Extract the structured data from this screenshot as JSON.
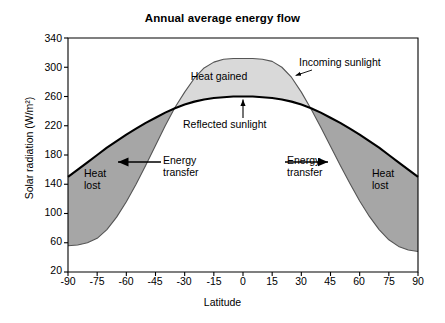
{
  "chart_data": {
    "type": "area",
    "title": "Annual average energy flow",
    "xlabel": "Latitude",
    "ylabel": "Solar radiation (W/m²)",
    "xlim": [
      -90,
      90
    ],
    "ylim": [
      20,
      340
    ],
    "xticks": [
      -90,
      -75,
      -60,
      -45,
      -30,
      -15,
      0,
      15,
      30,
      45,
      60,
      75,
      90
    ],
    "yticks": [
      20,
      60,
      100,
      140,
      180,
      220,
      260,
      300,
      340
    ],
    "xtick_labels": [
      "-90",
      "-75",
      "-60",
      "-45",
      "-30",
      "-15",
      "0",
      "15",
      "30",
      "45",
      "60",
      "75",
      "90"
    ],
    "ytick_labels": [
      "20",
      "60",
      "100",
      "140",
      "180",
      "220",
      "260",
      "300",
      "340"
    ],
    "grid": false,
    "legend": "none",
    "x": [
      -90,
      -85,
      -80,
      -75,
      -70,
      -65,
      -60,
      -55,
      -50,
      -45,
      -40,
      -35,
      -30,
      -25,
      -20,
      -15,
      -10,
      -5,
      0,
      5,
      10,
      15,
      20,
      25,
      30,
      35,
      40,
      45,
      50,
      55,
      60,
      65,
      70,
      75,
      80,
      85,
      90
    ],
    "series": [
      {
        "name": "Incoming sunlight",
        "values": [
          56,
          57,
          60,
          66,
          78,
          95,
          116,
          140,
          166,
          193,
          220,
          245,
          266,
          285,
          299,
          307,
          311,
          312,
          312,
          312,
          311,
          308,
          300,
          286,
          266,
          243,
          218,
          192,
          166,
          141,
          117,
          96,
          78,
          64,
          55,
          50,
          48
        ]
      },
      {
        "name": "Reflected sunlight",
        "values": [
          150,
          160,
          170,
          180,
          190,
          199,
          208,
          216,
          224,
          231,
          238,
          244,
          249,
          253,
          256,
          258,
          259,
          260,
          260,
          260,
          259,
          258,
          256,
          253,
          249,
          244,
          238,
          231,
          224,
          216,
          208,
          199,
          190,
          180,
          170,
          160,
          150
        ]
      }
    ],
    "regions": [
      {
        "name": "heat-gained",
        "label": "Heat gained",
        "color": "#d9d9d9",
        "between": [
          "Reflected sunlight",
          "Incoming sunlight"
        ],
        "where": "incoming > reflected"
      },
      {
        "name": "heat-lost-left",
        "label": "Heat lost",
        "color": "#a6a6a6",
        "between": [
          "Incoming sunlight",
          "Reflected sunlight"
        ],
        "where": "latitude < -34"
      },
      {
        "name": "heat-lost-right",
        "label": "Heat lost",
        "color": "#a6a6a6",
        "between": [
          "Incoming sunlight",
          "Reflected sunlight"
        ],
        "where": "latitude > 34"
      }
    ],
    "annotations": [
      {
        "name": "incoming-sunlight",
        "text": "Incoming sunlight",
        "points_to": [
          26,
          282
        ]
      },
      {
        "name": "reflected-sunlight",
        "text": "Reflected sunlight",
        "points_to": [
          0,
          260
        ]
      },
      {
        "name": "heat-gained",
        "text": "Heat gained",
        "at": [
          -6,
          288
        ]
      },
      {
        "name": "energy-transfer-left",
        "text": "Energy\ntransfer",
        "arrow": "left",
        "at": [
          -40,
          168
        ]
      },
      {
        "name": "energy-transfer-right",
        "text": "Energy\ntransfer",
        "arrow": "right",
        "at": [
          40,
          168
        ]
      },
      {
        "name": "heat-lost-left",
        "text": "Heat\nlost",
        "at": [
          -72,
          145
        ]
      },
      {
        "name": "heat-lost-right",
        "text": "Heat\nlost",
        "at": [
          72,
          145
        ]
      }
    ]
  },
  "colors": {
    "axis": "#000000",
    "curve": "#000000",
    "heat_gained_fill": "#d9d9d9",
    "heat_lost_fill": "#a6a6a6",
    "background": "#ffffff"
  },
  "labels": {
    "title": "Annual average energy flow",
    "ylabel": "Solar radiation (W/m²)",
    "xlabel": "Latitude",
    "heat_gained": "Heat gained",
    "heat_lost_left": "Heat\nlost",
    "heat_lost_right": "Heat\nlost",
    "incoming_sunlight": "Incoming sunlight",
    "reflected_sunlight": "Reflected sunlight",
    "energy_transfer_left": "Energy\ntransfer",
    "energy_transfer_right": "Energy\ntransfer",
    "ytick_0": "20",
    "ytick_1": "60",
    "ytick_2": "100",
    "ytick_3": "140",
    "ytick_4": "180",
    "ytick_5": "220",
    "ytick_6": "260",
    "ytick_7": "300",
    "ytick_8": "340",
    "xtick_0": "-90",
    "xtick_1": "-75",
    "xtick_2": "-60",
    "xtick_3": "-45",
    "xtick_4": "-30",
    "xtick_5": "-15",
    "xtick_6": "0",
    "xtick_7": "15",
    "xtick_8": "30",
    "xtick_9": "45",
    "xtick_10": "60",
    "xtick_11": "75",
    "xtick_12": "90"
  }
}
